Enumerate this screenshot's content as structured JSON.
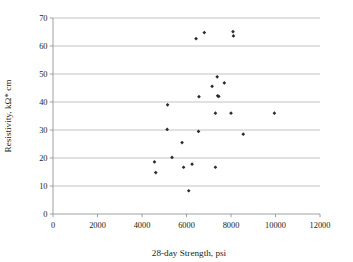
{
  "chart_data": {
    "type": "scatter",
    "title": "",
    "xlabel": "28-day Strength, psi",
    "ylabel": "Resistivity, kΩ* cm",
    "xlim": [
      0,
      12000
    ],
    "ylim": [
      0,
      70
    ],
    "xticks": [
      0,
      2000,
      4000,
      6000,
      8000,
      10000,
      12000
    ],
    "yticks": [
      0,
      10,
      20,
      30,
      40,
      50,
      60,
      70
    ],
    "xtick_labels": [
      "0",
      "2000",
      "4000",
      "6000",
      "8000",
      "10000",
      "12000"
    ],
    "ytick_labels": [
      "0",
      "10",
      "20",
      "30",
      "40",
      "50",
      "60",
      "70"
    ],
    "grid": "horizontal",
    "legend": "none",
    "marker": "diamond",
    "marker_color": "#2b2b2b",
    "series": [
      {
        "name": "Resistivity vs 28-day Strength",
        "points": [
          [
            4560,
            18.6
          ],
          [
            4620,
            14.8
          ],
          [
            5150,
            39.0
          ],
          [
            5130,
            30.2
          ],
          [
            5350,
            20.2
          ],
          [
            5800,
            25.5
          ],
          [
            5870,
            16.7
          ],
          [
            6100,
            8.3
          ],
          [
            6250,
            17.8
          ],
          [
            6430,
            62.6
          ],
          [
            6560,
            41.9
          ],
          [
            6540,
            29.5
          ],
          [
            6800,
            64.8
          ],
          [
            7150,
            45.6
          ],
          [
            7300,
            36.0
          ],
          [
            7380,
            49.0
          ],
          [
            7400,
            42.2
          ],
          [
            7450,
            42.0
          ],
          [
            7300,
            16.7
          ],
          [
            7700,
            46.8
          ],
          [
            8090,
            65.1
          ],
          [
            8110,
            63.6
          ],
          [
            8000,
            36.0
          ],
          [
            8550,
            28.5
          ],
          [
            9950,
            36.0
          ]
        ]
      }
    ]
  },
  "axis_titles": {
    "x": "28-day Strength, psi",
    "y": "Resistivity, kΩ* cm"
  }
}
